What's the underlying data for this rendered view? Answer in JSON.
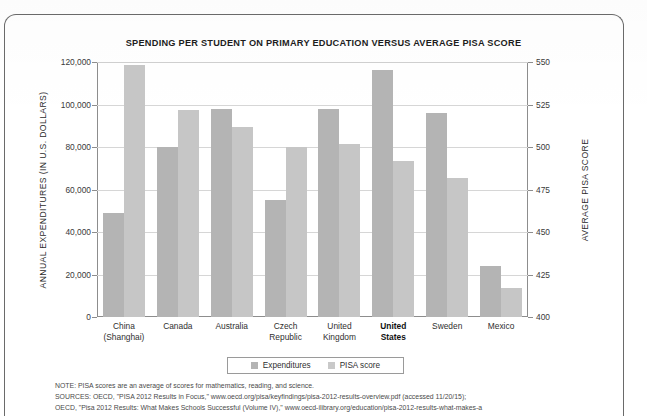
{
  "figure": {
    "title": "SPENDING PER STUDENT ON PRIMARY EDUCATION  VERSUS AVERAGE PISA SCORE"
  },
  "legend": {
    "items": [
      {
        "label": "Expenditures",
        "color": "#b4b4b4",
        "icon": "square-swatch-icon"
      },
      {
        "label": "PISA score",
        "color": "#c9c9c9",
        "icon": "square-swatch-icon"
      }
    ]
  },
  "axes": {
    "left_title": "ANNUAL EXPENDITURES (IN U.S. DOLLARS)",
    "right_title": "AVERAGE PISA SCORE",
    "left_ticks": [
      "120,000",
      "100,000",
      "80,000",
      "60,000",
      "40,000",
      "20,000",
      "0"
    ],
    "right_ticks": [
      "550",
      "525",
      "500",
      "475",
      "450",
      "425",
      "400"
    ]
  },
  "notes": {
    "lines": [
      "NOTE: PISA scores are an average of scores for mathematics, reading, and science.",
      "SOURCES: OECD, \"PISA 2012 Results in Focus,\" www.oecd.org/pisa/keyfindings/pisa-2012-results-overview.pdf (accessed 11/20/15);",
      "OECD, \"Pisa 2012 Results: What Makes Schools Successful (Volume IV),\" www.oecd-ilibrary.org/education/pisa-2012-results-what-makes-a"
    ]
  },
  "chart_data": {
    "type": "bar",
    "title": "SPENDING PER STUDENT ON PRIMARY EDUCATION  VERSUS AVERAGE PISA SCORE",
    "xlabel": "",
    "ylabel": "ANNUAL EXPENDITURES (IN U.S. DOLLARS)",
    "y2label": "AVERAGE PISA SCORE",
    "ylim": [
      0,
      120000
    ],
    "y2lim": [
      400,
      550
    ],
    "ytick_step": 20000,
    "y2tick_step": 25,
    "grid": true,
    "legend_position": "bottom",
    "categories": [
      "China\n(Shanghai)",
      "Canada",
      "Australia",
      "Czech\nRepublic",
      "United\nKingdom",
      "United\nStates",
      "Sweden",
      "Mexico"
    ],
    "highlighted_category": "United\nStates",
    "series": [
      {
        "name": "Expenditures",
        "axis": "left",
        "units": "U.S. dollars",
        "color": "#b4b4b4",
        "values": [
          49000,
          80000,
          98000,
          55000,
          98000,
          116000,
          96000,
          24000
        ]
      },
      {
        "name": "PISA score",
        "axis": "right",
        "units": "score",
        "color": "#c6c6c6",
        "values": [
          548,
          522,
          512,
          500,
          502,
          492,
          482,
          417
        ]
      }
    ]
  }
}
